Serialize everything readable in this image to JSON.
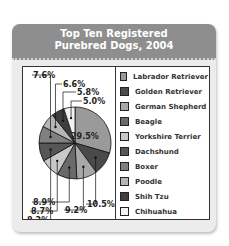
{
  "chart_data": {
    "type": "pie",
    "title": "Top Ten Registered Purebred Dogs, 2004",
    "categories": [
      "Labrador Retriever",
      "Golden Retriever",
      "German Shepherd",
      "Beagle",
      "Yorkshire Terrier",
      "Dachshund",
      "Boxer",
      "Poodle",
      "Shih Tzu",
      "Chihuahua"
    ],
    "values": [
      29.5,
      10.5,
      9.2,
      8.9,
      8.7,
      8.2,
      7.6,
      6.6,
      5.8,
      5.0
    ],
    "colors": [
      "#9a9a9a",
      "#4a4a4a",
      "#a8a8a8",
      "#6a6a6a",
      "#c8c8c8",
      "#575757",
      "#808080",
      "#b5b5b5",
      "#3e3e3e",
      "#f2f2f2"
    ],
    "labels": [
      "29.5%",
      "10.5%",
      "9.2%",
      "8.9%",
      "8.7%",
      "8.2%",
      "7.6%",
      "6.6%",
      "5.8%",
      "5.0%"
    ],
    "legend_position": "right"
  },
  "header": {
    "line1": "Top Ten Registered",
    "line2": "Purebred Dogs, 2004"
  },
  "legend": [
    {
      "label": "Labrador Retriever",
      "color": "#9a9a9a"
    },
    {
      "label": "Golden Retriever",
      "color": "#4a4a4a"
    },
    {
      "label": "German Shepherd",
      "color": "#a8a8a8"
    },
    {
      "label": "Beagle",
      "color": "#6a6a6a"
    },
    {
      "label": "Yorkshire Terrier",
      "color": "#c8c8c8"
    },
    {
      "label": "Dachshund",
      "color": "#575757"
    },
    {
      "label": "Boxer",
      "color": "#808080"
    },
    {
      "label": "Poodle",
      "color": "#b5b5b5"
    },
    {
      "label": "Shih Tzu",
      "color": "#3e3e3e"
    },
    {
      "label": "Chihuahua",
      "color": "#f2f2f2"
    }
  ]
}
